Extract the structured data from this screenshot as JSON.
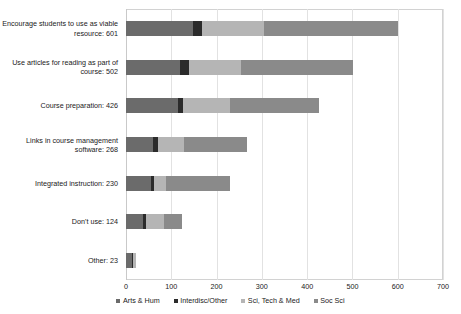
{
  "chart_data": {
    "type": "bar",
    "orientation": "horizontal",
    "stacked": true,
    "title": "",
    "xlabel": "",
    "ylabel": "",
    "xlim": [
      0,
      700
    ],
    "xticks": [
      0,
      100,
      200,
      300,
      400,
      500,
      600,
      700
    ],
    "xtick_labels": [
      "0",
      "100",
      "200",
      "300",
      "400",
      "500",
      "600",
      "700"
    ],
    "grid": true,
    "legend_position": "bottom",
    "categories": [
      "Encourage students to use as viable resource: 601",
      "Use articles for reading as part of course: 502",
      "Course preparation: 426",
      "Links in course management software: 268",
      "Integrated instruction: 230",
      "Don't use: 124",
      "Other: 23"
    ],
    "category_totals": [
      601,
      502,
      426,
      268,
      230,
      124,
      23
    ],
    "series": [
      {
        "name": "Arts & Hum",
        "color": "#6b6b6b",
        "values": [
          148,
          120,
          115,
          60,
          55,
          38,
          14
        ]
      },
      {
        "name": "Interdisc/Other",
        "color": "#2b2b2b",
        "values": [
          20,
          20,
          11,
          10,
          7,
          6,
          1
        ]
      },
      {
        "name": "Sci, Tech & Med",
        "color": "#b5b5b5",
        "values": [
          137,
          115,
          103,
          58,
          26,
          39,
          8
        ]
      },
      {
        "name": "Soc Sci",
        "color": "#8a8a8a",
        "values": [
          296,
          247,
          197,
          140,
          142,
          41,
          0
        ]
      }
    ]
  },
  "legend": {
    "items": [
      {
        "label": "Arts & Hum",
        "color": "#6b6b6b"
      },
      {
        "label": "Interdisc/Other",
        "color": "#2b2b2b"
      },
      {
        "label": "Sci, Tech & Med",
        "color": "#b5b5b5"
      },
      {
        "label": "Soc Sci",
        "color": "#8a8a8a"
      }
    ]
  }
}
